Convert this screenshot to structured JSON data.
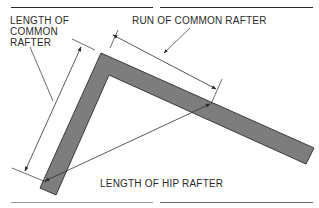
{
  "diagram": {
    "labels": {
      "length_common_rafter": "LENGTH OF\nCOMMON\nRAFTER",
      "run_common_rafter": "RUN OF COMMON RAFTER",
      "length_hip_rafter": "LENGTH OF HIP RAFTER"
    },
    "colors": {
      "rafter_fill": "#7d7d7d",
      "rafter_stroke": "#3a3a3a",
      "line": "#2e2e2e",
      "text": "#2b2b2b"
    }
  }
}
